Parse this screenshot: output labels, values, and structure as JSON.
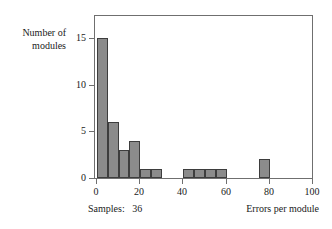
{
  "chart_data": {
    "type": "bar",
    "title": "",
    "subtitle": "",
    "xlabel": "Errors per module",
    "ylabel": "Number of modules",
    "ylabel_lines": [
      "Number of",
      "modules"
    ],
    "xlim": [
      0,
      100
    ],
    "ylim": [
      0,
      16.5
    ],
    "grid": false,
    "legend": null,
    "bin_width": 5,
    "bin_starts": [
      0,
      5,
      10,
      15,
      20,
      25,
      30,
      35,
      40,
      45,
      50,
      55,
      60,
      65,
      70,
      75,
      80,
      85,
      90,
      95
    ],
    "values": [
      15,
      6,
      3,
      4,
      1,
      1,
      0,
      0,
      1,
      1,
      1,
      1,
      0,
      0,
      0,
      2,
      0,
      0,
      0,
      0
    ],
    "bars": [
      {
        "x0": 0,
        "x1": 5,
        "value": 15
      },
      {
        "x0": 5,
        "x1": 10,
        "value": 6
      },
      {
        "x0": 10,
        "x1": 15,
        "value": 3
      },
      {
        "x0": 15,
        "x1": 20,
        "value": 4
      },
      {
        "x0": 20,
        "x1": 25,
        "value": 1
      },
      {
        "x0": 25,
        "x1": 30,
        "value": 1
      },
      {
        "x0": 40,
        "x1": 45,
        "value": 1
      },
      {
        "x0": 45,
        "x1": 50,
        "value": 1
      },
      {
        "x0": 50,
        "x1": 55,
        "value": 1
      },
      {
        "x0": 55,
        "x1": 60,
        "value": 1
      },
      {
        "x0": 75,
        "x1": 80,
        "value": 2
      }
    ],
    "xticks": [
      0,
      20,
      40,
      60,
      80,
      100
    ],
    "xtick_labels": [
      "0",
      "20",
      "40",
      "60",
      "80",
      "100"
    ],
    "yticks": [
      0,
      5,
      10,
      15
    ],
    "ytick_labels": [
      "0",
      "5",
      "10",
      "15"
    ],
    "bar_fill_color": "#8b8b8b",
    "bar_edge_color": "#3d3d3d",
    "axis_color": "#6f6f6f",
    "text_color": "#1a1a1a",
    "background_color": "#ffffff",
    "annotations": {
      "samples_label": "Samples:",
      "samples_value": "36",
      "samples_caption": "Samples:   36"
    }
  }
}
